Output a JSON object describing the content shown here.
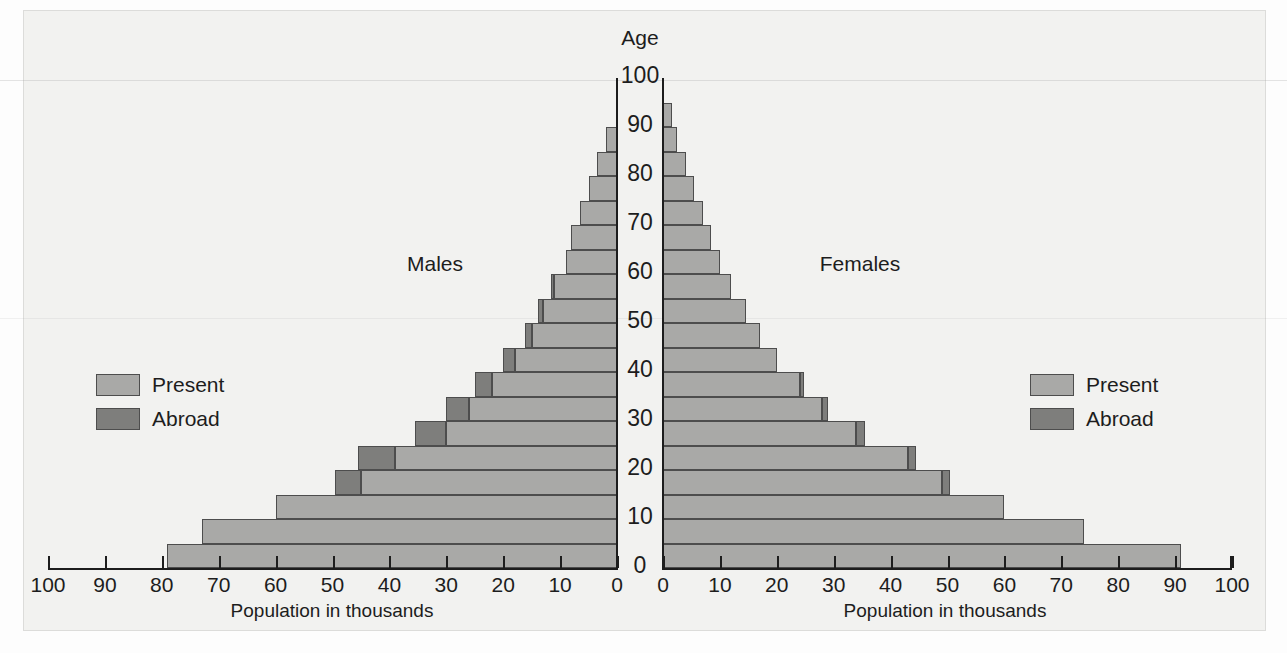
{
  "figure": {
    "age_axis_title": "Age",
    "males_label": "Males",
    "females_label": "Females",
    "xaxis_title_left": "Population in thousands",
    "xaxis_title_right": "Population in thousands",
    "colors": {
      "present": "#a9a9a7",
      "abroad": "#7e7e7c",
      "background": "#f2f2f0",
      "text": "#1d1d1d",
      "axis": "#1d1d1d"
    }
  },
  "legend_left": {
    "items": [
      {
        "label": "Present",
        "color": "#a9a9a7"
      },
      {
        "label": "Abroad",
        "color": "#7e7e7c"
      }
    ]
  },
  "legend_right": {
    "items": [
      {
        "label": "Present",
        "color": "#a9a9a7"
      },
      {
        "label": "Abroad",
        "color": "#7e7e7c"
      }
    ]
  },
  "chart_data": {
    "type": "bar",
    "subtype": "population-pyramid",
    "title": "",
    "xlabel": "Population in thousands",
    "ylabel": "Age",
    "xlim_left": [
      100,
      0
    ],
    "xlim_right": [
      0,
      100
    ],
    "ylim": [
      0,
      100
    ],
    "grid": false,
    "legend_position": "inside-left-and-right",
    "xticks_left": [
      "100",
      "90",
      "80",
      "70",
      "60",
      "50",
      "40",
      "30",
      "20",
      "10",
      "0"
    ],
    "xticks_right": [
      "0",
      "10",
      "20",
      "30",
      "40",
      "50",
      "60",
      "70",
      "80",
      "90",
      "100"
    ],
    "yticks": [
      "0",
      "10",
      "20",
      "30",
      "40",
      "50",
      "60",
      "70",
      "80",
      "90",
      "100"
    ],
    "age_groups": [
      "0-5",
      "5-10",
      "10-15",
      "15-20",
      "20-25",
      "25-30",
      "30-35",
      "35-40",
      "40-45",
      "45-50",
      "50-55",
      "55-60",
      "60-65",
      "65-70",
      "70-75",
      "75-80",
      "80-85",
      "85-90",
      "90-95",
      "95-100"
    ],
    "series": [
      {
        "name": "Males Present",
        "side": "left",
        "color": "#a9a9a7",
        "values": [
          79,
          73,
          60,
          45,
          39,
          30,
          26,
          22,
          18,
          15,
          13,
          11,
          9,
          8,
          6.5,
          5,
          3.5,
          2,
          0,
          0
        ]
      },
      {
        "name": "Males Abroad",
        "side": "left",
        "color": "#7e7e7c",
        "values": [
          0,
          0,
          0,
          4.5,
          6.5,
          5.5,
          4,
          3,
          2,
          1.2,
          0.8,
          0.6,
          0,
          0,
          0,
          0,
          0,
          0,
          0,
          0
        ]
      },
      {
        "name": "Females Present",
        "side": "right",
        "color": "#a9a9a7",
        "values": [
          91,
          74,
          60,
          49,
          43,
          34,
          28,
          24,
          20,
          17,
          14.5,
          12,
          10,
          8.5,
          7,
          5.5,
          4,
          2.5,
          1.5,
          0
        ]
      },
      {
        "name": "Females Abroad",
        "side": "right",
        "color": "#7e7e7c",
        "values": [
          0,
          0,
          0,
          1.5,
          1.5,
          1.5,
          1,
          0.8,
          0,
          0,
          0,
          0,
          0,
          0,
          0,
          0,
          0,
          0,
          0,
          0
        ]
      }
    ],
    "totals_left": [
      79,
      73,
      60,
      49.5,
      45.5,
      35.5,
      30,
      25,
      20,
      16.2,
      13.8,
      11.6,
      9,
      8,
      6.5,
      5,
      3.5,
      2,
      0,
      0
    ],
    "totals_right": [
      91,
      74,
      60,
      50.5,
      44.5,
      35.5,
      29,
      24.8,
      20,
      17,
      14.5,
      12,
      10,
      8.5,
      7,
      5.5,
      4,
      2.5,
      1.5,
      0
    ]
  }
}
